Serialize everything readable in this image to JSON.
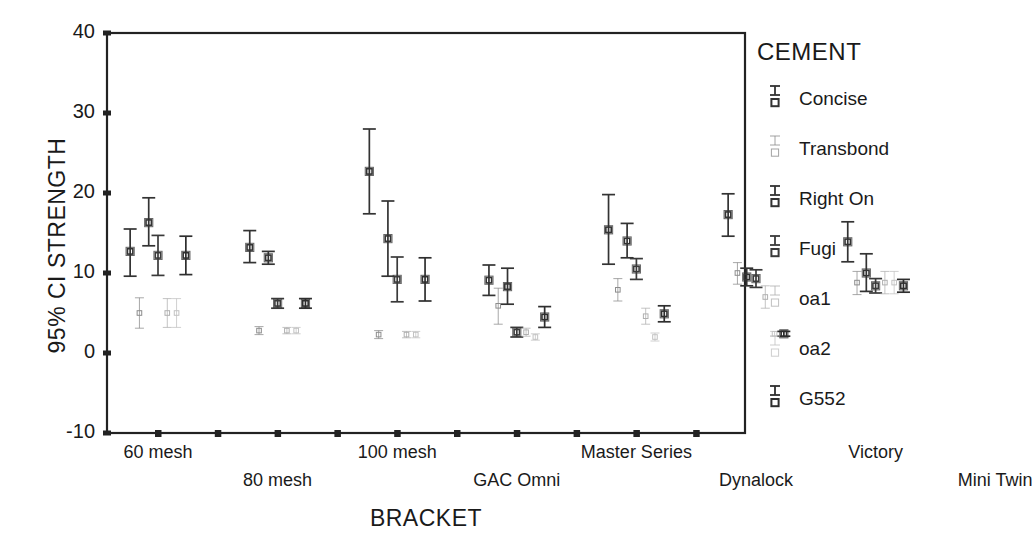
{
  "chart_data": {
    "type": "scatter",
    "title": "",
    "xlabel": "BRACKET",
    "ylabel": "95% CI STRENGTH",
    "ylim": [
      -10,
      40
    ],
    "yticks": [
      40,
      30,
      20,
      10,
      0,
      -10
    ],
    "grid": false,
    "legend_position": "right",
    "legend_title": "CEMENT",
    "categories": [
      "60 mesh",
      "80 mesh",
      "100 mesh",
      "GAC Omni",
      "Master Series",
      "Dynalock",
      "Victory",
      "Mini Twin"
    ],
    "series": [
      {
        "name": "Concise",
        "color": "#333333",
        "values": [
          12.7,
          13.2,
          22.7,
          9.1,
          15.4,
          17.3,
          13.9,
          15.3
        ],
        "ci_low": [
          9.6,
          11.3,
          17.4,
          7.2,
          11.1,
          14.6,
          11.4,
          12.0
        ],
        "ci_high": [
          15.5,
          15.3,
          28.0,
          11.0,
          19.8,
          19.9,
          16.4,
          18.5
        ]
      },
      {
        "name": "Transbond",
        "color": "#8c8c8c",
        "values": [
          5.0,
          2.8,
          2.3,
          5.9,
          7.9,
          10.0,
          8.8,
          9.5
        ],
        "ci_low": [
          3.1,
          2.3,
          1.8,
          3.6,
          6.5,
          8.6,
          7.3,
          8.2
        ],
        "ci_high": [
          6.9,
          3.3,
          2.8,
          8.1,
          9.3,
          11.3,
          10.2,
          10.7
        ]
      },
      {
        "name": "Right On",
        "color": "#333333",
        "values": [
          16.3,
          11.9,
          14.3,
          8.3,
          14.0,
          9.5,
          10.0,
          11.0
        ],
        "ci_low": [
          13.4,
          11.1,
          9.6,
          6.1,
          11.9,
          8.4,
          7.7,
          9.6
        ],
        "ci_high": [
          19.4,
          12.7,
          19.0,
          10.6,
          16.2,
          10.6,
          12.4,
          12.3
        ]
      },
      {
        "name": "Fugi",
        "color": "#3a3a3a",
        "values": [
          12.2,
          6.2,
          9.2,
          2.6,
          10.5,
          9.3,
          8.4,
          9.2
        ],
        "ci_low": [
          9.7,
          5.6,
          6.4,
          2.0,
          9.2,
          8.2,
          7.5,
          8.6
        ],
        "ci_high": [
          14.7,
          6.8,
          12.0,
          3.2,
          11.8,
          10.4,
          9.3,
          9.9
        ]
      },
      {
        "name": "oa1",
        "color": "#b0b0b0",
        "values": [
          5.0,
          2.8,
          2.3,
          2.6,
          4.6,
          7.0,
          8.8,
          9.5
        ],
        "ci_low": [
          3.2,
          2.4,
          1.9,
          2.1,
          3.6,
          5.6,
          7.4,
          8.3
        ],
        "ci_high": [
          6.8,
          3.2,
          2.7,
          3.1,
          5.6,
          8.4,
          10.2,
          10.7
        ]
      },
      {
        "name": "oa2",
        "color": "#c2c2c2",
        "values": [
          5.0,
          2.8,
          2.3,
          2.0,
          2.0,
          2.4,
          8.8,
          9.5
        ],
        "ci_low": [
          3.2,
          2.4,
          1.9,
          1.6,
          1.5,
          2.1,
          7.4,
          8.3
        ],
        "ci_high": [
          6.8,
          3.2,
          2.7,
          2.4,
          2.5,
          2.7,
          10.2,
          10.7
        ]
      },
      {
        "name": "G552",
        "color": "#2e2e2e",
        "values": [
          12.2,
          6.2,
          9.2,
          4.5,
          4.9,
          2.4,
          8.4,
          9.2
        ],
        "ci_low": [
          9.8,
          5.6,
          6.5,
          3.2,
          3.9,
          2.1,
          7.6,
          8.6
        ],
        "ci_high": [
          14.6,
          6.8,
          11.9,
          5.8,
          5.9,
          2.7,
          9.2,
          9.8
        ]
      }
    ]
  },
  "axis": {
    "ytick_labels": [
      "40",
      "30",
      "20",
      "10",
      "0",
      "-10"
    ],
    "xtick_labels": [
      "60 mesh",
      "80 mesh",
      "100 mesh",
      "GAC Omni",
      "Master Series",
      "Dynalock",
      "Victory",
      "Mini Twin"
    ],
    "xlabel": "BRACKET",
    "ylabel": "95% CI STRENGTH"
  },
  "legend": {
    "title": "CEMENT",
    "items": [
      {
        "label": "Concise",
        "color": "#333333"
      },
      {
        "label": "Transbond",
        "color": "#8c8c8c"
      },
      {
        "label": "Right On",
        "color": "#333333"
      },
      {
        "label": "Fugi",
        "color": "#3a3a3a"
      },
      {
        "label": "oa1",
        "color": "#b0b0b0"
      },
      {
        "label": "oa2",
        "color": "#c2c2c2"
      },
      {
        "label": "G552",
        "color": "#2e2e2e"
      }
    ]
  }
}
